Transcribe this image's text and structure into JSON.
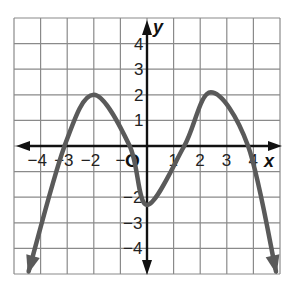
{
  "chart_data": {
    "type": "line",
    "title": "",
    "xlabel": "x",
    "ylabel": "y",
    "origin_label": "O",
    "xlim": [
      -5,
      5
    ],
    "ylim": [
      -5,
      5
    ],
    "grid": true,
    "x_ticks": [
      -4,
      -3,
      -2,
      -1,
      1,
      2,
      3,
      4
    ],
    "x_tick_labels": [
      "−4",
      "−3",
      "−2",
      "−",
      "1",
      "2",
      "3",
      "4"
    ],
    "y_ticks": [
      4,
      3,
      2,
      1,
      -2,
      -3,
      -4
    ],
    "y_tick_labels": [
      "4",
      "3",
      "2",
      "1",
      "−2",
      "−3",
      "−4"
    ],
    "series": [
      {
        "name": "polynomial function",
        "color": "#5a5a5a",
        "arrows_both_ends": true,
        "points": [
          {
            "x": -4.45,
            "y": -4.9
          },
          {
            "x": -3.1,
            "y": 0
          },
          {
            "x": -2.0,
            "y": 2.0
          },
          {
            "x": -0.65,
            "y": 0
          },
          {
            "x": 0.0,
            "y": -2.3
          },
          {
            "x": 1.4,
            "y": 0
          },
          {
            "x": 2.4,
            "y": 2.1
          },
          {
            "x": 3.8,
            "y": 0
          },
          {
            "x": 4.85,
            "y": -4.9
          }
        ],
        "features": {
          "local_max": [
            {
              "x": -2,
              "y": 2
            },
            {
              "x": 2.4,
              "y": 2.1
            }
          ],
          "local_min": [
            {
              "x": 0,
              "y": -2.3
            }
          ],
          "x_intercepts": [
            -3.1,
            -0.65,
            1.4,
            3.8
          ],
          "y_intercept": -2.3
        }
      }
    ]
  },
  "colors": {
    "grid": "#8a8a8a",
    "axes": "#111111",
    "curve": "#5a5a5a",
    "background": "#ffffff"
  }
}
